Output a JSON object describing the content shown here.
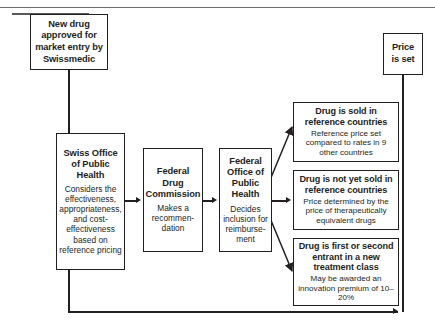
{
  "diagram": {
    "type": "flowchart",
    "colors": {
      "line": "#231f20",
      "box_border": "#231f20",
      "background": "#ffffff",
      "rule": "#6d6e71"
    },
    "nodes": {
      "new_drug": {
        "heading": "New drug approved for market entry by Swissmedic"
      },
      "price_set": {
        "heading": "Price is set"
      },
      "swiss_office": {
        "heading": "Swiss Office of Public Health",
        "body": "Considers the effectiveness, appropriateness, and cost-effectiveness based on reference pricing"
      },
      "federal_drug_commission": {
        "heading": "Federal Drug Commission",
        "body": "Makes a recommen-dation"
      },
      "federal_office": {
        "heading": "Federal Office of Public Health",
        "body": "Decides inclusion for reimburse-ment"
      },
      "outcome_sold": {
        "heading": "Drug is sold in reference countries",
        "body": "Reference price set compared to rates in 9 other countries"
      },
      "outcome_not_sold": {
        "heading": "Drug is not yet sold in reference countries",
        "body": "Price determined by the price of therapeutically equivalent drugs"
      },
      "outcome_entrant": {
        "heading": "Drug is first or second entrant in a new treatment class",
        "body": "May be awarded an innovation premium of 10–20%"
      }
    }
  }
}
